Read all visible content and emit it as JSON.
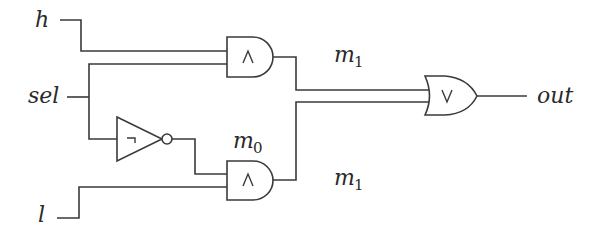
{
  "diagram": {
    "type": "logic-circuit",
    "inputs": [
      {
        "id": "h",
        "label": "h"
      },
      {
        "id": "sel",
        "label": "sel"
      },
      {
        "id": "l",
        "label": "l"
      }
    ],
    "output": {
      "id": "out",
      "label": "out"
    },
    "gates": [
      {
        "id": "and-top",
        "kind": "AND",
        "symbol": "∧",
        "inputs": [
          "h",
          "sel"
        ],
        "output": "m1"
      },
      {
        "id": "not",
        "kind": "NOT",
        "symbol": "¬",
        "inputs": [
          "sel"
        ],
        "output": "m0"
      },
      {
        "id": "and-bottom",
        "kind": "AND",
        "symbol": "∧",
        "inputs": [
          "m0",
          "l"
        ],
        "output": "m1"
      },
      {
        "id": "or",
        "kind": "OR",
        "symbol": "∨",
        "inputs": [
          "m1",
          "m1"
        ],
        "output": "out"
      }
    ],
    "signals": [
      {
        "id": "m1-top",
        "base": "m",
        "subscript": "1"
      },
      {
        "id": "m0",
        "base": "m",
        "subscript": "0"
      },
      {
        "id": "m1-bottom",
        "base": "m",
        "subscript": "1"
      }
    ],
    "colors": {
      "stroke": "#3a3a3a",
      "text": "#2a2a2a",
      "background": "#ffffff"
    }
  }
}
